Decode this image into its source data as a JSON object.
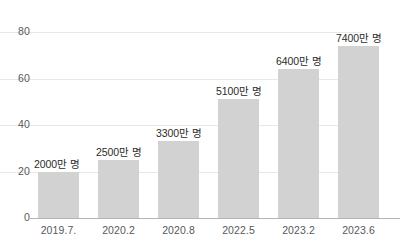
{
  "chart_data": {
    "type": "bar",
    "title": "",
    "subtitle": "",
    "xlabel": "",
    "ylabel": "",
    "categories": [
      "2019.7.",
      "2020.2",
      "2020.8",
      "2022.5",
      "2023.2",
      "2023.6"
    ],
    "values": [
      20,
      25,
      33,
      51,
      64,
      74
    ],
    "data_labels": [
      "2000만 명",
      "2500만 명",
      "3300만 명",
      "5100만 명",
      "6400만 명",
      "7400만 명"
    ],
    "series": [
      {
        "name": "",
        "values": [
          20,
          25,
          33,
          51,
          64,
          74
        ]
      }
    ],
    "ylim": [
      0,
      80
    ],
    "y_ticks": [
      "0",
      "20",
      "40",
      "60",
      "80"
    ],
    "y_tick_values": [
      0,
      20,
      40,
      60,
      80
    ],
    "grid": true,
    "grid_axis": "y",
    "legend": false,
    "legend_position": "none",
    "colors": {
      "bar_fill": "#d2d2d2",
      "gridline": "#e8e8e8",
      "axis_line": "#b4b4b4",
      "tick_text": "#58595b",
      "label_text": "#2b2b2b",
      "background": "#ffffff"
    }
  }
}
